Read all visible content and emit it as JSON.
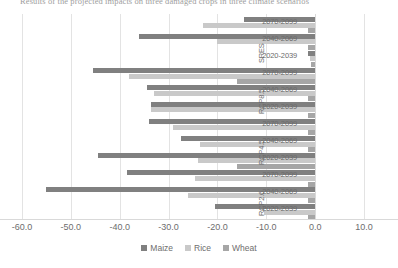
{
  "caption": "Results of the projected impacts on three damaged crops in three climate scenarios",
  "chart_data": {
    "type": "bar",
    "orientation": "horizontal",
    "title": "",
    "xlabel": "",
    "ylabel": "",
    "xlim": [
      -60,
      10
    ],
    "xticks": [
      -60.0,
      -50.0,
      -40.0,
      -30.0,
      -20.0,
      -10.0,
      0.0,
      10.0
    ],
    "xticklabels": [
      "-60.0",
      "-50.0",
      "-40.0",
      "-30.0",
      "-20.0",
      "-10.0",
      "0.0",
      "10.0"
    ],
    "grid": true,
    "legend_position": "bottom",
    "legend": [
      "Maize",
      "Rice",
      "Wheat"
    ],
    "series_colors": [
      "#808080",
      "#c9c9c9",
      "#a6a6a6"
    ],
    "groups": [
      {
        "label": "SRES",
        "periods": [
          {
            "label": "2070-2099",
            "values": {
              "Maize": -14.5,
              "Rice": -23.0,
              "Wheat": -1.5
            }
          },
          {
            "label": "2040-2069",
            "values": {
              "Maize": -36.0,
              "Rice": -20.0,
              "Wheat": -1.5
            }
          },
          {
            "label": "2020-2039",
            "values": {
              "Maize": -1.5,
              "Rice": -1.0,
              "Wheat": -0.8
            }
          }
        ]
      },
      {
        "label": "RCP8.5",
        "periods": [
          {
            "label": "2070-2099",
            "values": {
              "Maize": -45.5,
              "Rice": -38.0,
              "Wheat": -16.0
            }
          },
          {
            "label": "2040-2069",
            "values": {
              "Maize": -34.5,
              "Rice": -33.0,
              "Wheat": -1.5
            }
          },
          {
            "label": "2020-2039",
            "values": {
              "Maize": -33.5,
              "Rice": -33.5,
              "Wheat": -1.5
            }
          }
        ]
      },
      {
        "label": "RCP4.5",
        "periods": [
          {
            "label": "2070-2099",
            "values": {
              "Maize": -34.0,
              "Rice": -29.0,
              "Wheat": -1.5
            }
          },
          {
            "label": "2040-2069",
            "values": {
              "Maize": -27.5,
              "Rice": -23.5,
              "Wheat": -1.5
            }
          },
          {
            "label": "2020-2039",
            "values": {
              "Maize": -44.5,
              "Rice": -24.0,
              "Wheat": -16.0
            }
          }
        ]
      },
      {
        "label": "RCP2.6",
        "periods": [
          {
            "label": "2070-2099",
            "values": {
              "Maize": -38.5,
              "Rice": -24.5,
              "Wheat": -1.5
            }
          },
          {
            "label": "2040-2069",
            "values": {
              "Maize": -55.0,
              "Rice": -26.0,
              "Wheat": -1.5
            }
          },
          {
            "label": "2020-2039",
            "values": {
              "Maize": -20.5,
              "Rice": -10.5,
              "Wheat": -1.5
            }
          }
        ]
      }
    ]
  }
}
